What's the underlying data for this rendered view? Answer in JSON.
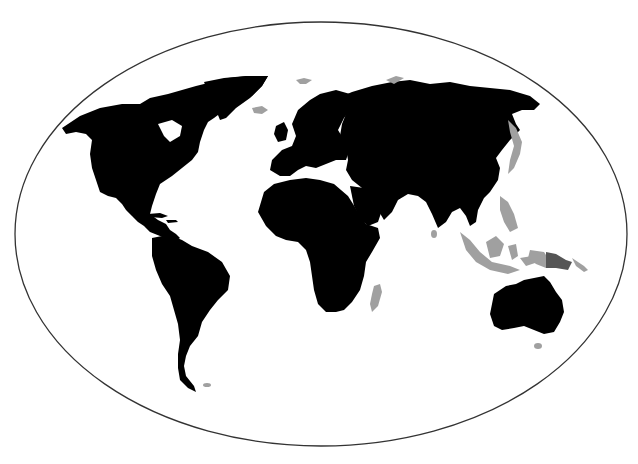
{
  "map": {
    "projection": "elliptical world map",
    "colors": {
      "background": "#ffffff",
      "land": "#000000",
      "highlight_region": "#a0a0a0",
      "highlight_region_dark": "#555555",
      "frame": "#333333"
    },
    "highlighted_areas": [
      "Indonesia / Maritime Southeast Asia",
      "Philippines",
      "Japan",
      "Madagascar",
      "Iceland",
      "Svalbard",
      "Novaya Zemlya",
      "New Zealand / Tasmania",
      "Falkland Islands",
      "Papua New Guinea"
    ],
    "legend": null
  }
}
